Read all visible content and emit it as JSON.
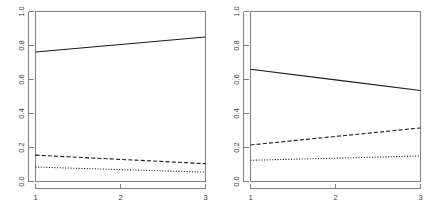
{
  "chart_data": [
    {
      "panel": "left",
      "type": "line",
      "title": "",
      "xlabel": "",
      "ylabel": "",
      "x": [
        1,
        2,
        3
      ],
      "xlim": [
        1,
        3
      ],
      "ylim": [
        0.0,
        1.0
      ],
      "xticks": [
        "1",
        "2",
        "3"
      ],
      "yticks": [
        "0.0",
        "0.2",
        "0.4",
        "0.6",
        "0.8",
        "1.0"
      ],
      "ytick_values": [
        0.0,
        0.2,
        0.4,
        0.6,
        0.8,
        1.0
      ],
      "grid": false,
      "legend": "none",
      "series": [
        {
          "name": "solid",
          "linetype": "solid",
          "color": "#1a1a1a",
          "values": [
            0.762,
            0.806,
            0.85
          ]
        },
        {
          "name": "dashed",
          "linetype": "dashed",
          "color": "#1a1a1a",
          "values": [
            0.155,
            0.13,
            0.105
          ]
        },
        {
          "name": "dotted",
          "linetype": "dotted",
          "color": "#1a1a1a",
          "values": [
            0.085,
            0.07,
            0.055
          ]
        }
      ]
    },
    {
      "panel": "right",
      "type": "line",
      "title": "",
      "xlabel": "",
      "ylabel": "",
      "x": [
        1,
        2,
        3
      ],
      "xlim": [
        1,
        3
      ],
      "ylim": [
        0.0,
        1.0
      ],
      "xticks": [
        "1",
        "2",
        "3"
      ],
      "yticks": [
        "0.0",
        "0.2",
        "0.4",
        "0.6",
        "0.8",
        "1.0"
      ],
      "ytick_values": [
        0.0,
        0.2,
        0.4,
        0.6,
        0.8,
        1.0
      ],
      "grid": false,
      "legend": "none",
      "series": [
        {
          "name": "solid",
          "linetype": "solid",
          "color": "#1a1a1a",
          "values": [
            0.66,
            0.598,
            0.535
          ]
        },
        {
          "name": "dashed",
          "linetype": "dashed",
          "color": "#1a1a1a",
          "values": [
            0.215,
            0.265,
            0.315
          ]
        },
        {
          "name": "dotted",
          "linetype": "dotted",
          "color": "#1a1a1a",
          "values": [
            0.125,
            0.137,
            0.15
          ]
        }
      ]
    }
  ],
  "figure": {
    "background": "#ffffff",
    "axis_color": "#808080",
    "line_color": "#1a1a1a",
    "panel_count": 2
  }
}
